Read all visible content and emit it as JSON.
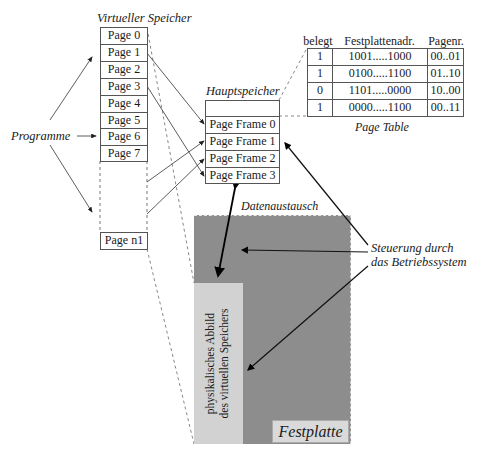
{
  "virtual_memory": {
    "title": "Virtueller Speicher",
    "pages": [
      "Page 0",
      "Page 1",
      "Page 2",
      "Page 3",
      "Page 4",
      "Page 5",
      "Page 6",
      "Page 7"
    ],
    "last_page": "Page n1"
  },
  "programs_label": "Programme",
  "main_memory": {
    "title": "Hauptspeicher",
    "frames": [
      "Page Frame 0",
      "Page Frame 1",
      "Page Frame 2",
      "Page Frame 3"
    ]
  },
  "page_table": {
    "title": "Page Table",
    "headers": [
      "belegt",
      "Festplattenadr.",
      "Pagenr."
    ],
    "rows": [
      [
        "1",
        "1001.....1000",
        "00..01"
      ],
      [
        "1",
        "0100.....1100",
        "01..10"
      ],
      [
        "0",
        "1101.....0000",
        "10..00"
      ],
      [
        "1",
        "0000.....1100",
        "00..11"
      ]
    ]
  },
  "data_exchange_label": "Datenaustausch",
  "os_control_label": [
    "Steuerung durch",
    "das Betriebssystem"
  ],
  "disk": {
    "label": "Festplatte",
    "image_label": [
      "physikalisches Abbild",
      "des virtuellen Speichers"
    ],
    "colors": {
      "disk": "#8d8d8d",
      "image": "#d2d2d2",
      "label_bg": "#dadada"
    }
  }
}
